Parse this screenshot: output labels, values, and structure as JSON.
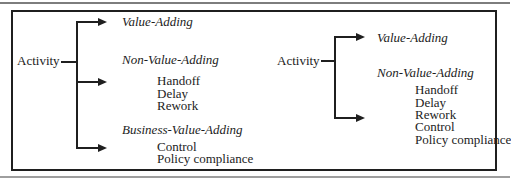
{
  "figure": {
    "background": "#ffffff",
    "box_border_color": "#1f1f1f",
    "top_rule_color": "#7d7d7d",
    "bottom_rule_color": "#9e9e9e",
    "text_color": "#1c1c1c"
  },
  "left_tree": {
    "root": "Activity",
    "branches": [
      {
        "label": "Value-Adding",
        "items": []
      },
      {
        "label": "Non-Value-Adding",
        "items": [
          "Handoff",
          "Delay",
          "Rework"
        ]
      },
      {
        "label": "Business-Value-Adding",
        "items": [
          "Control",
          "Policy compliance"
        ]
      }
    ]
  },
  "right_tree": {
    "root": "Activity",
    "branches": [
      {
        "label": "Value-Adding",
        "items": []
      },
      {
        "label": "Non-Value-Adding",
        "items": [
          "Handoff",
          "Delay",
          "Rework",
          "Control",
          "Policy compliance"
        ]
      }
    ]
  }
}
